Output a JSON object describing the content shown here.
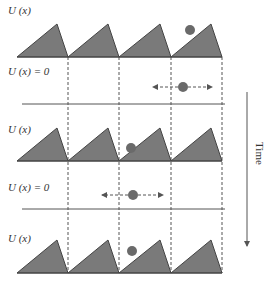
{
  "labels": {
    "row1": "U (x)",
    "row2": "U (x) = 0",
    "row3": "U (x)",
    "row4": "U (x) = 0",
    "row5": "U (x)",
    "time": "Time"
  },
  "colors": {
    "fill": "#7a7a7a",
    "stroke": "#444444",
    "dot": "#6a6a6a",
    "line": "#555555"
  },
  "diagram": {
    "dashed_x": [
      68,
      119,
      171,
      222
    ],
    "sawtooth_rows": [
      {
        "baseline": 57,
        "peak": 24,
        "dot": {
          "x": 190,
          "y": 30
        }
      },
      {
        "baseline": 161,
        "peak": 128,
        "dot": {
          "x": 131,
          "y": 148
        }
      },
      {
        "baseline": 273,
        "peak": 240,
        "dot": {
          "x": 132,
          "y": 251
        }
      }
    ],
    "flat_rows": [
      {
        "line_y": 104,
        "arrow_y": 87,
        "arrow_from": 153,
        "arrow_to": 212,
        "dot_x": 183
      },
      {
        "line_y": 209,
        "arrow_y": 195,
        "arrow_from": 102,
        "arrow_to": 163,
        "dot_x": 133
      }
    ]
  }
}
